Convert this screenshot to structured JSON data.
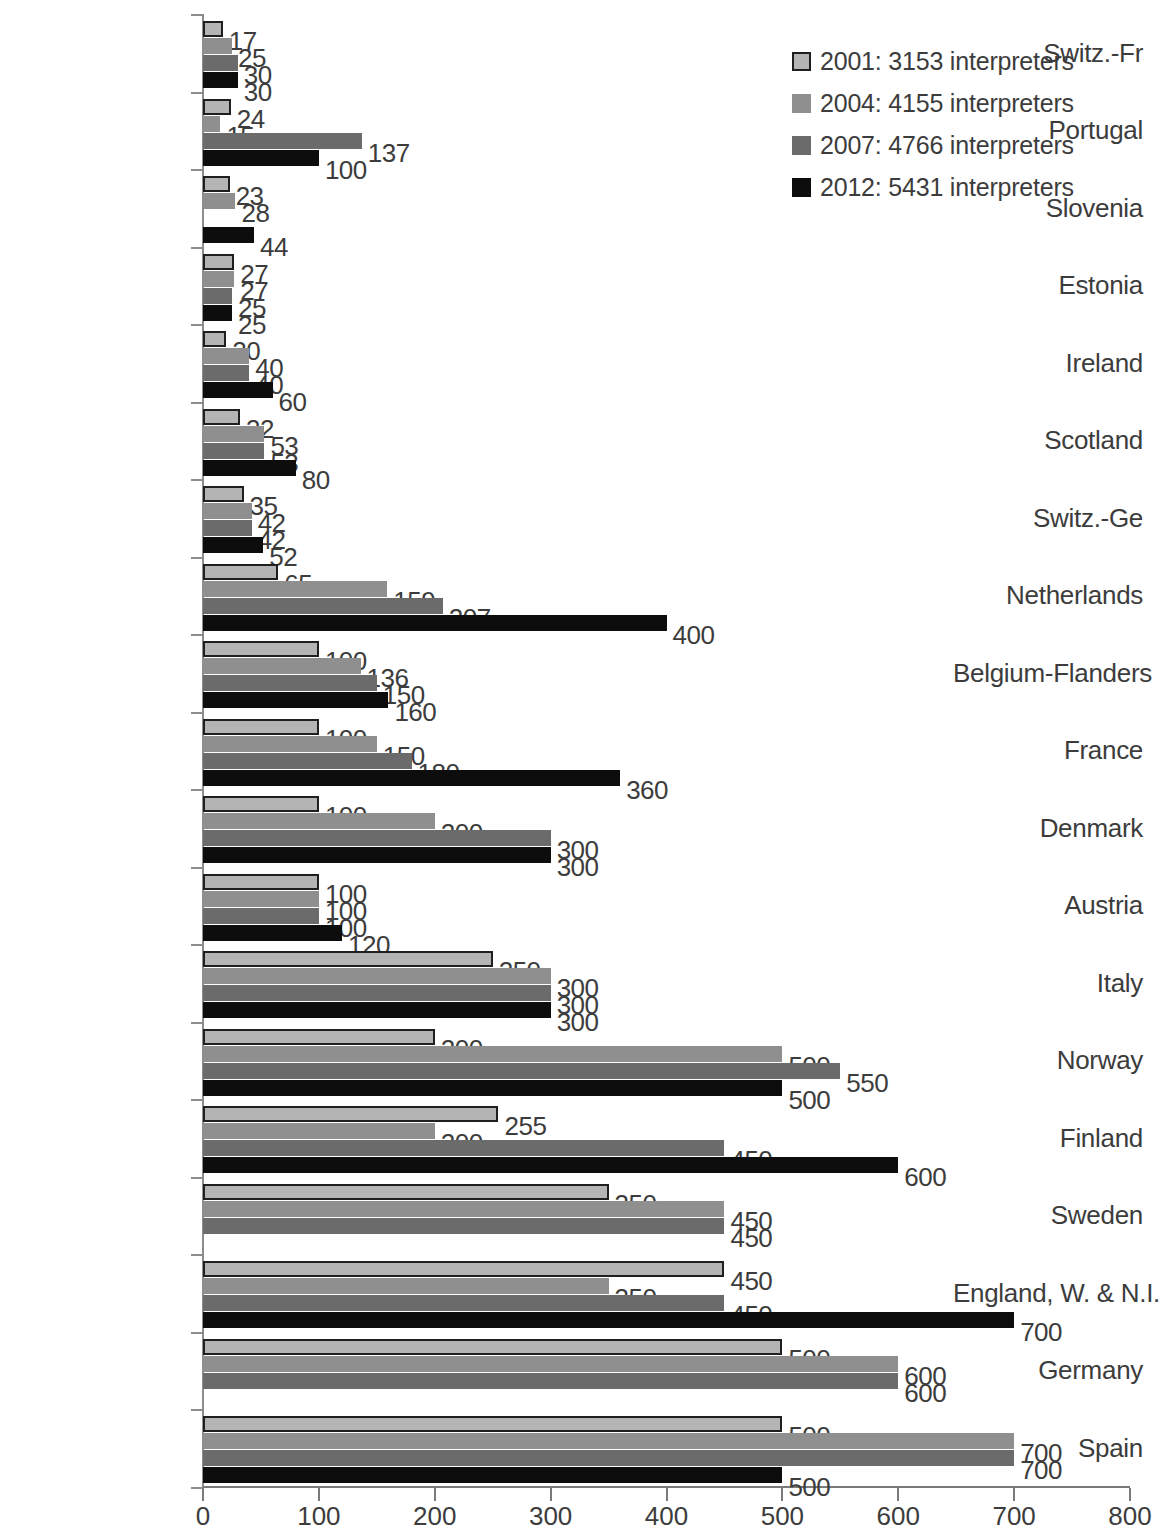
{
  "chart_data": {
    "type": "bar",
    "orientation": "horizontal",
    "title": "",
    "subtitle": "",
    "xlabel": "",
    "ylabel": "",
    "xlim": [
      0,
      800
    ],
    "xticks": [
      0,
      100,
      200,
      300,
      400,
      500,
      600,
      700,
      800
    ],
    "grid": false,
    "legend_position": "top-right",
    "legend": [
      "2001: 3153 interpreters",
      "2004: 4155 interpreters",
      "2007: 4766 interpreters",
      "2012: 5431 interpreters"
    ],
    "series_colors": [
      "#b4b4b4",
      "#8f8f8f",
      "#6b6b6b",
      "#0d0d0d"
    ],
    "categories": [
      "Switz.-Fr",
      "Portugal",
      "Slovenia",
      "Estonia",
      "Ireland",
      "Scotland",
      "Switz.-Ge",
      "Netherlands",
      "Belgium-Flanders",
      "France",
      "Denmark",
      "Austria",
      "Italy",
      "Norway",
      "Finland",
      "Sweden",
      "England, W. & N.I.",
      "Germany",
      "Spain"
    ],
    "series": [
      {
        "name": "2001: 3153 interpreters",
        "values": [
          17,
          24,
          23,
          27,
          20,
          32,
          35,
          65,
          100,
          100,
          100,
          100,
          250,
          200,
          255,
          350,
          450,
          500,
          500
        ]
      },
      {
        "name": "2004: 4155 interpreters",
        "values": [
          25,
          15,
          28,
          27,
          40,
          53,
          42,
          159,
          136,
          150,
          200,
          100,
          300,
          500,
          200,
          450,
          350,
          600,
          700
        ]
      },
      {
        "name": "2007: 4766 interpreters",
        "values": [
          30,
          137,
          null,
          25,
          40,
          53,
          42,
          207,
          150,
          180,
          300,
          100,
          300,
          550,
          450,
          450,
          450,
          600,
          700
        ]
      },
      {
        "name": "2012: 5431 interpreters",
        "values": [
          30,
          100,
          44,
          25,
          60,
          80,
          52,
          400,
          160,
          360,
          300,
          120,
          300,
          500,
          600,
          null,
          700,
          null,
          500
        ]
      }
    ]
  }
}
